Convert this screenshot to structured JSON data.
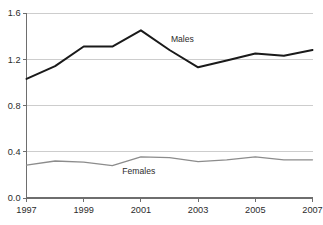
{
  "chart_data": {
    "type": "line",
    "title": "",
    "subtitle": "",
    "xlabel": "",
    "ylabel": "",
    "x": [
      1997,
      1998,
      1999,
      2000,
      2001,
      2002,
      2003,
      2004,
      2005,
      2006,
      2007
    ],
    "xlim": [
      1997,
      2007
    ],
    "ylim": [
      0.0,
      1.6
    ],
    "xticks": [
      1997,
      1999,
      2001,
      2003,
      2005,
      2007
    ],
    "xtick_labels": [
      "1997",
      "1999",
      "2001",
      "2003",
      "2005",
      "2007"
    ],
    "yticks": [
      0.0,
      0.4,
      0.8,
      1.2,
      1.6
    ],
    "ytick_labels": [
      "0.0",
      "0.4",
      "0.8",
      "1.2",
      "1.6"
    ],
    "grid": "horizontal",
    "legend_position": "inline-annotation",
    "series": [
      {
        "name": "Males",
        "color": "#1a1a1a",
        "stroke_width": 2.0,
        "label_text": "Males",
        "label_x": 2002.05,
        "label_y": 1.345,
        "values": [
          1.03,
          1.14,
          1.31,
          1.31,
          1.45,
          1.28,
          1.13,
          1.19,
          1.25,
          1.23,
          1.28
        ]
      },
      {
        "name": "Females",
        "color": "#8c8c8c",
        "stroke_width": 1.3,
        "label_text": "Females",
        "label_x": 2000.35,
        "label_y": 0.205,
        "values": [
          0.285,
          0.32,
          0.31,
          0.28,
          0.355,
          0.35,
          0.315,
          0.33,
          0.355,
          0.33,
          0.33
        ]
      }
    ]
  },
  "colors": {
    "background": "#ffffff",
    "gridline": "#c8c8c8",
    "axis": "#6e6e6e",
    "text": "#2b2b2b",
    "males_line": "#1a1a1a",
    "females_line": "#8c8c8c"
  }
}
